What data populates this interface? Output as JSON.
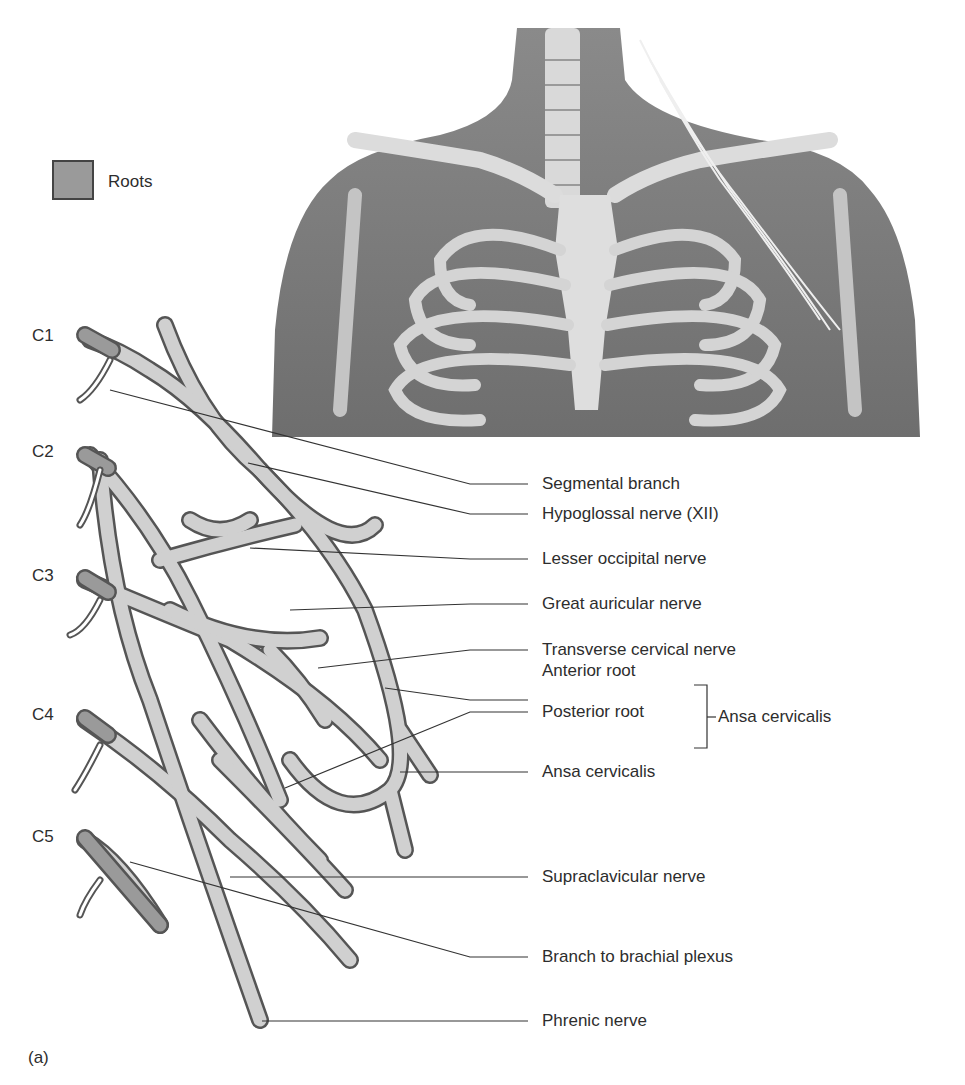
{
  "legend": {
    "swatch_color": "#9a9a9a",
    "label": "Roots"
  },
  "panel_label": "(a)",
  "root_levels": [
    "C1",
    "C2",
    "C3",
    "C4",
    "C5"
  ],
  "labels": [
    "Segmental branch",
    "Hypoglossal nerve (XII)",
    "Lesser occipital nerve",
    "Great auricular nerve",
    "Transverse cervical nerve",
    "Anterior root",
    "Posterior root",
    "Ansa cervicalis",
    "Supraclavicular nerve",
    "Branch to brachial plexus",
    "Phrenic nerve"
  ],
  "bracket_label": "Ansa cervicalis",
  "colors": {
    "nerve_fill": "#cfcfcf",
    "nerve_stroke": "#555555",
    "root_fill": "#9a9a9a",
    "body_fill": "#7d7d7d",
    "bone_fill": "#d8d8d8"
  }
}
